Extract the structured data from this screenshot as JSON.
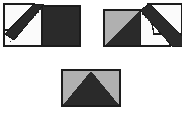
{
  "document": {
    "title": "Paper Folding Sequence",
    "kind": "instructional-fold-diagram",
    "panel_count": 3,
    "background_color": "#ffffff"
  },
  "palette": {
    "dark": "#2a2a2a",
    "dark_shade": "#333333",
    "grey": "#b0b0b0",
    "grey_light": "#c4c4c4",
    "white": "#fbfbfb",
    "outline": "#1c1c1c",
    "crease_line": "#2a2a2a"
  },
  "panels": [
    {
      "id": "step-1",
      "name": "fold-step-one",
      "label": "",
      "sheet": {
        "x": 4,
        "y": 6,
        "width": 76,
        "height": 40,
        "fill": "#fbfbfb",
        "stroke": "#1c1c1c"
      },
      "regions": [
        {
          "name": "right-dark-half",
          "shape": "rect",
          "fill": "#2a2a2a"
        },
        {
          "name": "left-white-half",
          "shape": "rect",
          "fill": "#fbfbfb"
        },
        {
          "name": "folded-flap-band",
          "shape": "polygon",
          "fill": "#2a2a2a"
        },
        {
          "name": "flap-tip-white",
          "shape": "polygon",
          "fill": "#fbfbfb"
        }
      ],
      "crease": {
        "name": "crease-dashed-line",
        "style": "dashed",
        "dash_pattern": "2 2",
        "orientation": "diagonal-up-right",
        "color": "#2a2a2a"
      }
    },
    {
      "id": "step-2",
      "name": "fold-step-two",
      "label": "",
      "sheet": {
        "x": 12,
        "y": 10,
        "width": 72,
        "height": 36,
        "fill": "#b0b0b0",
        "stroke": "#1c1c1c"
      },
      "regions": [
        {
          "name": "left-grey-half",
          "shape": "rect",
          "fill": "#b0b0b0"
        },
        {
          "name": "inner-dark-triangle",
          "shape": "polygon",
          "fill": "#2a2a2a"
        },
        {
          "name": "right-white-half",
          "shape": "rect",
          "fill": "#fbfbfb"
        },
        {
          "name": "folded-flap-band",
          "shape": "polygon",
          "fill": "#2a2a2a"
        },
        {
          "name": "flap-tip-white",
          "shape": "polygon",
          "fill": "#fbfbfb"
        }
      ],
      "crease": {
        "name": "crease-dashed-line",
        "style": "dashed",
        "dash_pattern": "2 2",
        "orientation": "diagonal-down-right",
        "color": "#2a2a2a"
      }
    },
    {
      "id": "step-3",
      "name": "fold-step-three-result",
      "label": "",
      "sheet": {
        "x": 6,
        "y": 6,
        "width": 58,
        "height": 36,
        "fill": "#b0b0b0",
        "stroke": "#1c1c1c"
      },
      "regions": [
        {
          "name": "grey-background",
          "shape": "rect",
          "fill": "#b0b0b0"
        },
        {
          "name": "dark-triangle",
          "shape": "polygon",
          "fill": "#2a2a2a"
        }
      ],
      "crease": null
    }
  ]
}
